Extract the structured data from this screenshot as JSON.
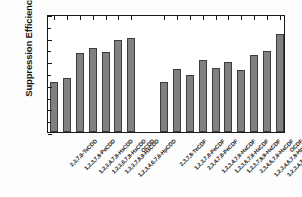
{
  "chart_data": {
    "type": "bar",
    "title": "",
    "xlabel": "",
    "ylabel": "Suppression Efficiency (%)",
    "ylim": [
      0,
      100
    ],
    "ytick_values": [
      0,
      20,
      40,
      60,
      80,
      100
    ],
    "ytick_labels": [
      "0",
      "20",
      "40",
      "60",
      "80",
      "100"
    ],
    "yminor_values": [
      10,
      30,
      50,
      70,
      90
    ],
    "grid": false,
    "legend": false,
    "bar_color": "#808080",
    "bar_edge_color": "#3d3d3d",
    "axis_color": "#1a1a1a",
    "groups": [
      {
        "name": "PCDDs",
        "categories": [
          "2,3,7,8-TeCDD",
          "1,2,3,7,8-PeCDD",
          "1,2,3,4,7,8-HxCDD",
          "1,2,3,6,7,8-HxCDD",
          "1,2,3,7,8,9-HxCDD",
          "1,2,3,4,6,7,8-HpCDD",
          "OCDD"
        ],
        "values": [
          42,
          46,
          67,
          71.5,
          68,
          78,
          80
        ]
      },
      {
        "name": "PCDFs",
        "categories": [
          "2,3,7,8-TeCDF",
          "1,2,3,7,8-PeCDF",
          "2,3,4,7,8-PeCDF",
          "1,2,3,4,7,8-HxCDF",
          "1,2,3,6,7,8-HxCDF",
          "1,2,3,7,8,9-HxCDF",
          "2,3,4,6,7,8-HxCDF",
          "1,2,3,4,6,7,8-HpCDF",
          "1,2,3,4,7,8,9-HpCDF",
          "OCDF"
        ],
        "values": [
          42.5,
          53.5,
          48,
          61,
          54.5,
          59,
          52.5,
          65,
          69,
          83
        ]
      }
    ]
  }
}
